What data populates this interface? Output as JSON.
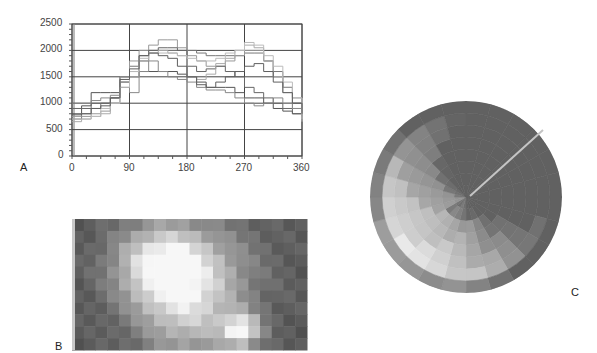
{
  "panels": {
    "a": {
      "label": "A"
    },
    "b": {
      "label": "B"
    },
    "c": {
      "label": "C"
    }
  },
  "chart_data": {
    "type": "line",
    "title": "",
    "xlabel": "",
    "ylabel": "",
    "xlim": [
      0,
      360
    ],
    "ylim": [
      0,
      2500
    ],
    "x_ticks": [
      "0",
      "90",
      "180",
      "270",
      "360"
    ],
    "y_ticks": [
      "0",
      "500",
      "1000",
      "1500",
      "2000",
      "2500"
    ],
    "grid": true,
    "legend": "none",
    "x": [
      0,
      15,
      30,
      45,
      60,
      75,
      90,
      105,
      120,
      135,
      150,
      165,
      180,
      195,
      210,
      225,
      240,
      255,
      270,
      285,
      300,
      315,
      330,
      345,
      360
    ],
    "series": [
      {
        "name": "profile-1",
        "color": "#555555",
        "values": [
          800,
          950,
          1200,
          1200,
          1200,
          1500,
          1600,
          1600,
          1600,
          1600,
          1600,
          1550,
          1500,
          1400,
          1300,
          1300,
          1300,
          1200,
          1100,
          1100,
          1000,
          900,
          850,
          800,
          750
        ]
      },
      {
        "name": "profile-2",
        "color": "#777777",
        "values": [
          700,
          800,
          900,
          1000,
          1100,
          1400,
          1700,
          1900,
          2000,
          2000,
          2000,
          2000,
          2000,
          1950,
          1900,
          1900,
          1900,
          1900,
          1950,
          1950,
          1800,
          1600,
          1300,
          1000,
          800
        ]
      },
      {
        "name": "profile-3",
        "color": "#999999",
        "values": [
          750,
          750,
          800,
          850,
          1000,
          1500,
          1800,
          2000,
          2100,
          2200,
          2200,
          2050,
          1900,
          1800,
          1700,
          1700,
          1800,
          1900,
          2000,
          2000,
          1800,
          1500,
          1300,
          1100,
          900
        ]
      },
      {
        "name": "profile-4",
        "color": "#666666",
        "values": [
          900,
          900,
          1000,
          1000,
          1100,
          1300,
          1500,
          1800,
          2000,
          2050,
          2050,
          2000,
          1700,
          1600,
          1650,
          1700,
          1600,
          1500,
          1300,
          1200,
          1100,
          1000,
          900,
          800,
          750
        ]
      },
      {
        "name": "profile-5",
        "color": "#aaaaaa",
        "values": [
          650,
          700,
          750,
          800,
          1000,
          1400,
          1500,
          1800,
          1950,
          2000,
          1950,
          1900,
          1500,
          1450,
          1550,
          1750,
          1850,
          2000,
          2100,
          2050,
          1800,
          1500,
          1200,
          900,
          700
        ]
      },
      {
        "name": "profile-6",
        "color": "#888888",
        "values": [
          1000,
          1000,
          1050,
          1100,
          1150,
          1400,
          1200,
          1600,
          1800,
          1600,
          1500,
          1450,
          1400,
          1300,
          1250,
          1250,
          1200,
          1100,
          1000,
          950,
          1000,
          1100,
          1000,
          900,
          850
        ]
      },
      {
        "name": "profile-7",
        "color": "#bbbbbb",
        "values": [
          700,
          700,
          750,
          900,
          1000,
          1300,
          1600,
          1850,
          1950,
          1950,
          1950,
          1900,
          1850,
          1800,
          1800,
          1850,
          1950,
          2000,
          2150,
          2100,
          1900,
          1700,
          1400,
          1100,
          650
        ]
      },
      {
        "name": "profile-8",
        "color": "#5f5f5f",
        "values": [
          780,
          800,
          900,
          950,
          1100,
          1450,
          1650,
          1900,
          1950,
          1900,
          1850,
          1700,
          1500,
          1350,
          1300,
          1400,
          1500,
          1600,
          1700,
          1750,
          1600,
          1400,
          1200,
          1000,
          800
        ]
      }
    ]
  }
}
